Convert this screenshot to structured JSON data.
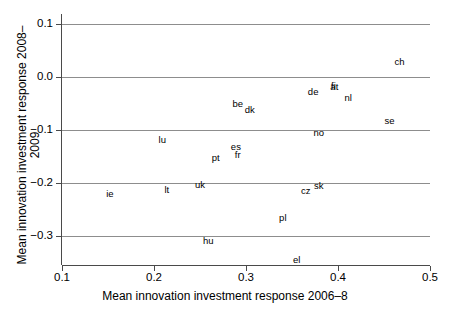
{
  "chart_data": {
    "type": "scatter",
    "title": "",
    "xlabel": "Mean innovation investment response 2006–8",
    "ylabel": "Mean innovation investment response 2008–2009",
    "xlim": [
      0.1,
      0.5
    ],
    "ylim": [
      -0.35,
      0.11
    ],
    "xticks": [
      "0.1",
      "0.2",
      "0.3",
      "0.4",
      "0.5"
    ],
    "xtick_values": [
      0.1,
      0.2,
      0.3,
      0.4,
      0.5
    ],
    "yticks": [
      "0.1",
      "0.0",
      "−0.1",
      "−0.2",
      "−0.3"
    ],
    "ytick_values": [
      0.1,
      0.0,
      -0.1,
      -0.2,
      -0.3
    ],
    "grid": "horizontal",
    "legend": "none",
    "marker": "text-label",
    "points": [
      {
        "label": "ch",
        "x": 0.467,
        "y": 0.028
      },
      {
        "label": "fi",
        "x": 0.395,
        "y": -0.017
      },
      {
        "label": "at",
        "x": 0.396,
        "y": -0.019
      },
      {
        "label": "de",
        "x": 0.373,
        "y": -0.029
      },
      {
        "label": "nl",
        "x": 0.411,
        "y": -0.04
      },
      {
        "label": "be",
        "x": 0.291,
        "y": -0.051
      },
      {
        "label": "dk",
        "x": 0.304,
        "y": -0.062
      },
      {
        "label": "se",
        "x": 0.456,
        "y": -0.083
      },
      {
        "label": "no",
        "x": 0.379,
        "y": -0.106
      },
      {
        "label": "lu",
        "x": 0.209,
        "y": -0.118
      },
      {
        "label": "es",
        "x": 0.289,
        "y": -0.133
      },
      {
        "label": "fr",
        "x": 0.291,
        "y": -0.147
      },
      {
        "label": "pt",
        "x": 0.267,
        "y": -0.152
      },
      {
        "label": "uk",
        "x": 0.25,
        "y": -0.204
      },
      {
        "label": "sk",
        "x": 0.379,
        "y": -0.206
      },
      {
        "label": "lt",
        "x": 0.214,
        "y": -0.213
      },
      {
        "label": "cz",
        "x": 0.365,
        "y": -0.215
      },
      {
        "label": "ie",
        "x": 0.152,
        "y": -0.221
      },
      {
        "label": "pl",
        "x": 0.34,
        "y": -0.266
      },
      {
        "label": "hu",
        "x": 0.259,
        "y": -0.309
      },
      {
        "label": "el",
        "x": 0.355,
        "y": -0.345
      }
    ]
  },
  "colors": {
    "grid": "#8d8d8d",
    "axis": "#4a4a4a",
    "text": "#000000",
    "background": "#ffffff"
  }
}
